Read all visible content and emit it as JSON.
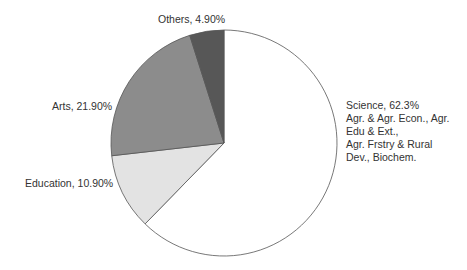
{
  "chart_data": {
    "type": "pie",
    "title": "",
    "start_angle_deg": 0,
    "direction": "clockwise",
    "slices": [
      {
        "name": "Science",
        "value": 62.3,
        "label": "Science, 62.3%",
        "color": "#ffffff",
        "extra_lines": [
          "Agr. & Agr. Econ., Agr.",
          "Edu & Ext.,",
          "Agr. Frstry & Rural",
          "Dev., Biochem."
        ]
      },
      {
        "name": "Education",
        "value": 10.9,
        "label": "Education, 10.90%",
        "color": "#e3e3e3"
      },
      {
        "name": "Arts",
        "value": 21.9,
        "label": "Arts, 21.90%",
        "color": "#8c8c8c"
      },
      {
        "name": "Others",
        "value": 4.9,
        "label": "Others, 4.90%",
        "color": "#575757"
      }
    ]
  },
  "labels": {
    "science_line1": "Science, 62.3%",
    "science_line2": "Agr. & Agr. Econ., Agr.",
    "science_line3": "Edu & Ext.,",
    "science_line4": "Agr. Frstry & Rural",
    "science_line5": "Dev., Biochem.",
    "education": "Education, 10.90%",
    "arts": "Arts, 21.90%",
    "others": "Others, 4.90%"
  }
}
